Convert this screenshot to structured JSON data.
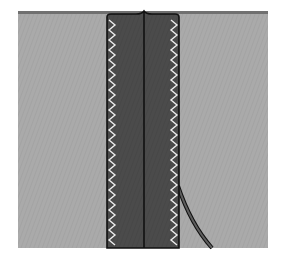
{
  "illustration": {
    "subject": "sewing seam diagram - zigzag-finished seam allowance pressed open",
    "colors": {
      "background": "#ffffff",
      "fabric": "#a9a9a9",
      "fabric_top_edge": "#6e6e6e",
      "seam_allowance": "#4a4a4a",
      "outline": "#111111",
      "zigzag_stitch": "#e8e8e8",
      "curved_edge": "#5e5e5e"
    },
    "fabric": {
      "x": 18,
      "y": 11,
      "width": 250,
      "height": 237
    },
    "seam_allowance": {
      "x_left": 107,
      "x_right": 179,
      "center_x": 144
    },
    "zigzag": {
      "left_x": 112,
      "right_x": 174,
      "amplitude": 3,
      "period": 10
    }
  }
}
